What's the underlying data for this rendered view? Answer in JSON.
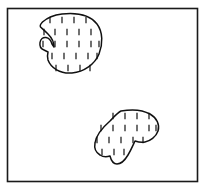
{
  "figure": {
    "canvas": {
      "width": 206,
      "height": 191,
      "background": "#ffffff"
    }
  },
  "colors": {
    "frame_stroke": "#1a1a1a",
    "scanline_stroke": "#3a3a3a",
    "blob_stroke": "#111111",
    "tick_stroke": "#111111",
    "background": "#ffffff"
  },
  "frame": {
    "label": "diagram-border",
    "x": 7.5,
    "y": 8.5,
    "width": 190,
    "height": 173,
    "stroke_width": 1.6
  },
  "scanlines": {
    "label": "horizontal-scan-lines",
    "count": 13,
    "x_start": 8,
    "x_end": 197,
    "stroke_width": 1.0,
    "y_values": [
      20,
      32,
      44,
      56,
      68,
      80,
      92,
      104,
      116,
      128,
      140,
      152,
      164
    ]
  },
  "regions": [
    {
      "id": "upper-region",
      "label": "Upper blob region",
      "path": "M 62 14 C 76 12.5 90 15 97 24 C 103 32 103 44 99 54 C 95 64 84 72 72 73 C 60 74 51 68 48 60 C 47 56.5 47.5 54 48 52 L 44 50 C 41 49 39.5 46 40 42.5 C 40.5 39 43 37 46 37.5 C 49 38 51 40.5 52 44 L 54 47 C 54 43 52 38 48 34 C 44 30 41.5 28 40.5 27 C 40 26 40.5 24 42.5 22 C 47 18 54 15 62 14 Z",
      "bbox": {
        "x": 39,
        "y": 12,
        "width": 65,
        "height": 63
      },
      "ticks": [
        {
          "y": 20,
          "xs": [
            50,
            62,
            74,
            86
          ]
        },
        {
          "y": 32,
          "xs": [
            44,
            55,
            67,
            79,
            91
          ]
        },
        {
          "y": 44,
          "xs": [
            43,
            55,
            67,
            79,
            91,
            99
          ]
        },
        {
          "y": 56,
          "xs": [
            52,
            64,
            76,
            88,
            97
          ]
        },
        {
          "y": 68,
          "xs": [
            56,
            68,
            80,
            90
          ]
        }
      ]
    },
    {
      "id": "lower-region",
      "label": "Lower blob region",
      "path": "M 121 111 C 132 109 143 110 150 114 C 157 118 160 125 158 131 C 156 137 150 141 145 142 C 141 143 138 142 135 141 C 133 145 131 150 128 155 C 125 160 121 164 117 164 C 113 164 111 160 110 156 C 107 157 103 157 100 155 C 96 152.5 94 148 95 143 C 96 136 102 128 110 121 C 113.5 117.5 117 113 121 111 Z",
      "bbox": {
        "x": 93,
        "y": 108,
        "width": 68,
        "height": 58
      },
      "ticks": [
        {
          "y": 116,
          "xs": [
            113,
            125,
            137,
            149
          ]
        },
        {
          "y": 128,
          "xs": [
            101,
            113,
            125,
            137,
            149,
            156
          ]
        },
        {
          "y": 140,
          "xs": [
            97,
            109,
            121,
            133,
            143
          ]
        },
        {
          "y": 152,
          "xs": [
            102,
            114,
            124
          ]
        }
      ]
    }
  ],
  "tick": {
    "label": "scanline-intersection-tick",
    "half_height": 3.2,
    "stroke_width": 1.2
  }
}
